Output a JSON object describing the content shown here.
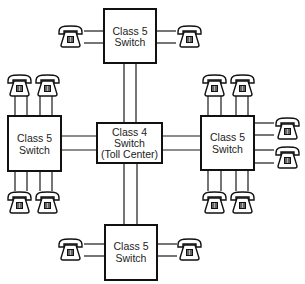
{
  "diagram": {
    "title": "",
    "colors": {
      "line": "#111111",
      "background": "#ffffff",
      "text": "#222222"
    },
    "nodes": {
      "top": {
        "type": "class5",
        "line1": "Class 5",
        "line2": "Switch"
      },
      "left": {
        "type": "class5",
        "line1": "Class 5",
        "line2": "Switch"
      },
      "center": {
        "type": "class4",
        "line1": "Class 4",
        "line2": "Switch",
        "line3": "(Toll Center)"
      },
      "right": {
        "type": "class5",
        "line1": "Class 5",
        "line2": "Switch"
      },
      "bottom": {
        "type": "class5",
        "line1": "Class 5",
        "line2": "Switch"
      }
    },
    "icon": "telephone-icon",
    "phone_counts": {
      "top": 2,
      "left": 4,
      "right": 6,
      "bottom": 2
    },
    "connections": [
      {
        "from": "center",
        "to": "top",
        "wires": 2
      },
      {
        "from": "center",
        "to": "left",
        "wires": 2
      },
      {
        "from": "center",
        "to": "right",
        "wires": 2
      },
      {
        "from": "center",
        "to": "bottom",
        "wires": 2
      }
    ]
  }
}
